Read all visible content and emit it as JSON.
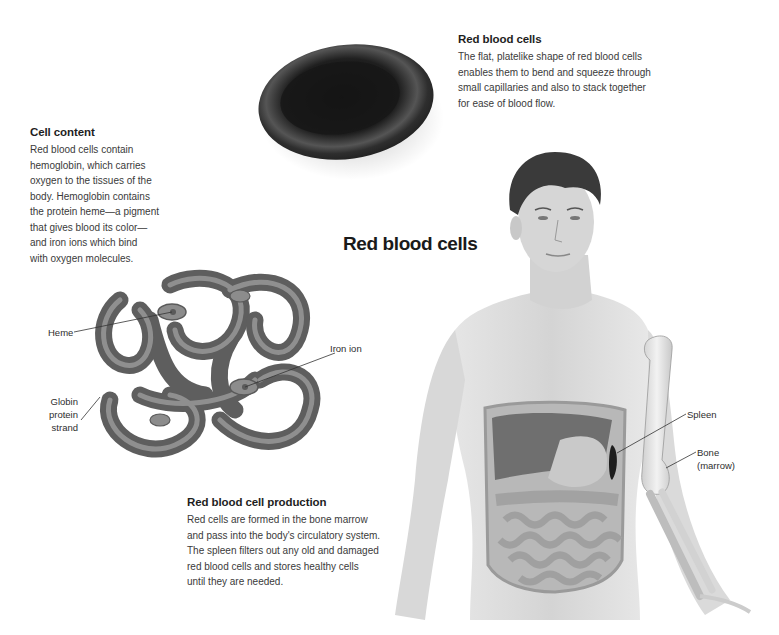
{
  "title": "Red blood cells",
  "sections": {
    "red_blood_cells": {
      "heading": "Red blood cells",
      "lines": [
        "The flat, platelike shape of red blood cells",
        "enables them to bend and squeeze through",
        "small capillaries and also to stack together",
        "for ease of blood flow."
      ]
    },
    "cell_content": {
      "heading": "Cell content",
      "lines": [
        "Red blood cells contain",
        "hemoglobin, which carries",
        "oxygen to the tissues of the",
        "body. Hemoglobin contains",
        "the protein heme—a pigment",
        "that gives blood its color—",
        "and iron ions which bind",
        "with oxygen molecules."
      ]
    },
    "production": {
      "heading": "Red blood cell production",
      "lines": [
        "Red cells are formed in the bone marrow",
        "and pass into the body's circulatory system.",
        "The spleen filters out any old and damaged",
        "red blood cells and stores healthy cells",
        "until they are needed."
      ]
    }
  },
  "hemoglobin_labels": {
    "heme": "Heme",
    "iron_ion": "Iron ion",
    "globin": [
      "Globin",
      "protein",
      "strand"
    ]
  },
  "body_labels": {
    "spleen": "Spleen",
    "bone": [
      "Bone",
      "(marrow)"
    ]
  },
  "illustrations": {
    "rbc": "red-blood-cell-disc",
    "hemoglobin": "hemoglobin-molecule",
    "body": "human-torso-with-organs-and-arm-bone"
  },
  "colors": {
    "background": "#ffffff",
    "text": "#2a2a2a",
    "cell_dark": "#1c1c1c",
    "tube": "#7a7a7a",
    "skin": "#d8d8d8",
    "organs": "#8a8a8a"
  }
}
